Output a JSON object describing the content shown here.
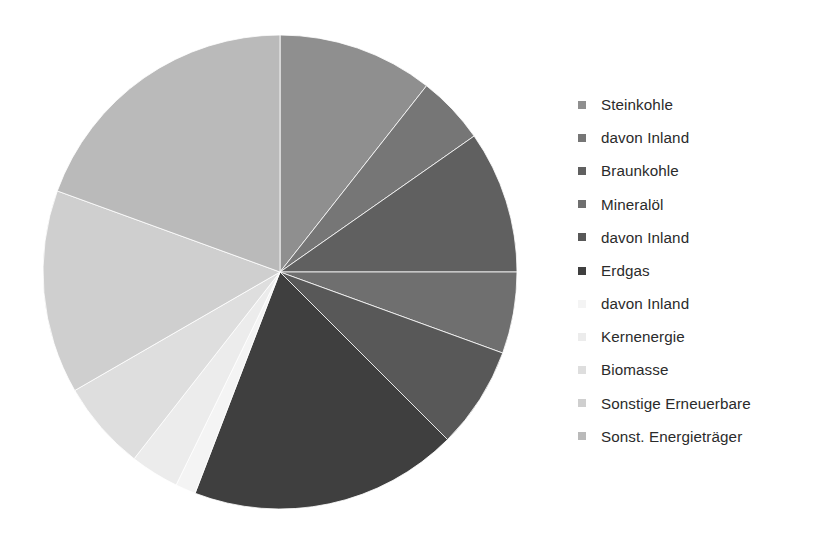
{
  "chart_data": {
    "type": "pie",
    "title": "",
    "subtitle": "",
    "xlabel": "",
    "ylabel": "",
    "legend_position": "right",
    "grid": false,
    "unit": "percent",
    "center": {
      "cx": 240,
      "cy": 244,
      "r": 237
    },
    "start_angle_deg": 0,
    "direction": "clockwise",
    "categories": [
      "Steinkohle",
      "davon Inland",
      "Braunkohle",
      "Mineralöl",
      "davon Inland",
      "Erdgas",
      "davon Inland",
      "Kernenergie",
      "Biomasse",
      "Sonstige Erneuerbare",
      "Sonst. Energieträger"
    ],
    "values": [
      10.6,
      4.7,
      9.7,
      5.6,
      6.9,
      18.3,
      1.4,
      3.3,
      6.1,
      13.9,
      19.5
    ],
    "colors": [
      "#8f8f8f",
      "#767676",
      "#606060",
      "#6f6f6f",
      "#585858",
      "#3f3f3f",
      "#f4f4f4",
      "#ececec",
      "#dedede",
      "#cfcfcf",
      "#bababa"
    ],
    "slice_angles_deg": [
      {
        "start": 0,
        "end": 38.2
      },
      {
        "start": 38.2,
        "end": 55.0
      },
      {
        "start": 55.0,
        "end": 90.0
      },
      {
        "start": 90.0,
        "end": 110.0
      },
      {
        "start": 110.0,
        "end": 135.0
      },
      {
        "start": 135.0,
        "end": 201.0
      },
      {
        "start": 201.0,
        "end": 206.0
      },
      {
        "start": 206.0,
        "end": 218.0
      },
      {
        "start": 218.0,
        "end": 240.0
      },
      {
        "start": 240.0,
        "end": 290.0
      },
      {
        "start": 290.0,
        "end": 360.0
      }
    ]
  },
  "legend": {
    "items": [
      {
        "label": "Steinkohle",
        "color": "#8f8f8f"
      },
      {
        "label": "davon Inland",
        "color": "#767676"
      },
      {
        "label": "Braunkohle",
        "color": "#606060"
      },
      {
        "label": "Mineralöl",
        "color": "#6f6f6f"
      },
      {
        "label": "davon Inland",
        "color": "#585858"
      },
      {
        "label": "Erdgas",
        "color": "#3f3f3f"
      },
      {
        "label": "davon Inland",
        "color": "#f4f4f4"
      },
      {
        "label": "Kernenergie",
        "color": "#ececec"
      },
      {
        "label": "Biomasse",
        "color": "#dedede"
      },
      {
        "label": "Sonstige Erneuerbare",
        "color": "#cfcfcf"
      },
      {
        "label": "Sonst. Energieträger",
        "color": "#bababa"
      }
    ]
  },
  "style": {
    "background": "#ffffff",
    "slice_separator": "#ffffff",
    "text_color": "#2b2b2b"
  }
}
